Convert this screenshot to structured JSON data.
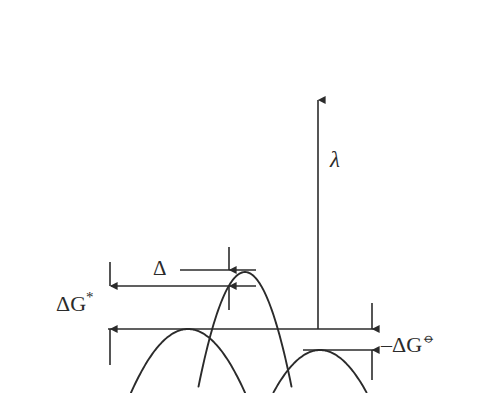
{
  "figure": {
    "background_color": "#ffffff",
    "stroke_color": "#2b2b2b",
    "width": 496,
    "height": 393
  },
  "labels": {
    "activation_energy": "ΔG",
    "activation_energy_superscript": "*",
    "delta": "Δ",
    "reorganization_energy": "λ",
    "reaction_free_energy": "–ΔG",
    "reaction_free_energy_superscript": "⦵"
  },
  "chart_data": {
    "type": "line",
    "xlabel": "",
    "ylabel": "",
    "grid": false,
    "legend": null,
    "axis_ranges": {
      "x": [
        0,
        496
      ],
      "y": [
        393,
        0
      ]
    },
    "series": [
      {
        "name": "reactant-parabola",
        "description": "Left free-energy parabola, minimum on the baseline",
        "vertex": [
          188,
          329
        ],
        "curvature_k": 0.0196,
        "x_start": 27,
        "x_end": 338,
        "points": [
          [
            27,
            329
          ],
          [
            60,
            329
          ],
          [
            100,
            329
          ],
          [
            140,
            329
          ],
          [
            188,
            329
          ],
          [
            240,
            329
          ],
          [
            290,
            329
          ],
          [
            338,
            329
          ]
        ]
      },
      {
        "name": "product-parabola",
        "description": "Right free-energy parabola, minimum below the baseline",
        "vertex": [
          320,
          350
        ],
        "curvature_k": 0.0196,
        "x_start": 152,
        "x_end": 473,
        "points": [
          [
            152,
            350
          ],
          [
            200,
            350
          ],
          [
            244,
            350
          ],
          [
            290,
            350
          ],
          [
            320,
            350
          ],
          [
            380,
            350
          ],
          [
            430,
            350
          ],
          [
            473,
            350
          ]
        ]
      },
      {
        "name": "excited-state-parabola",
        "description": "Narrow central parabola, minimum raised above the crossing point",
        "vertex": [
          245,
          272
        ],
        "curvature_k": 0.053,
        "x_start": 152,
        "x_end": 338,
        "points": [
          [
            152,
            272
          ],
          [
            190,
            272
          ],
          [
            220,
            272
          ],
          [
            245,
            272
          ],
          [
            275,
            272
          ],
          [
            310,
            272
          ],
          [
            338,
            272
          ]
        ]
      }
    ],
    "annotations": [
      {
        "name": "activation-energy",
        "label": "ΔG*",
        "type": "double-arrow-vertical",
        "x": 110,
        "y_top": 286,
        "y_bottom": 329,
        "value_px": 43
      },
      {
        "name": "delta-gap",
        "label": "Δ",
        "type": "double-arrow-vertical",
        "x": 229,
        "y_top": 270,
        "y_bottom": 286,
        "value_px": 16
      },
      {
        "name": "reorganization-energy",
        "label": "λ",
        "type": "single-arrow-up",
        "x": 318,
        "y_top": 100,
        "y_bottom": 329,
        "value_px": 229
      },
      {
        "name": "reaction-free-energy",
        "label": "–ΔG⦵",
        "type": "double-arrow-vertical",
        "x": 372,
        "y_top": 329,
        "y_bottom": 350,
        "value_px": 21
      }
    ],
    "reference_lines": [
      {
        "name": "crossing-level-upper",
        "y": 270,
        "x_start": 180,
        "x_end": 256
      },
      {
        "name": "crossing-level-lower",
        "y": 286,
        "x_start": 111,
        "x_end": 256
      },
      {
        "name": "reactant-baseline",
        "y": 329,
        "x_start": 108,
        "x_end": 374
      },
      {
        "name": "product-baseline",
        "y": 350,
        "x_start": 303,
        "x_end": 374
      }
    ]
  }
}
